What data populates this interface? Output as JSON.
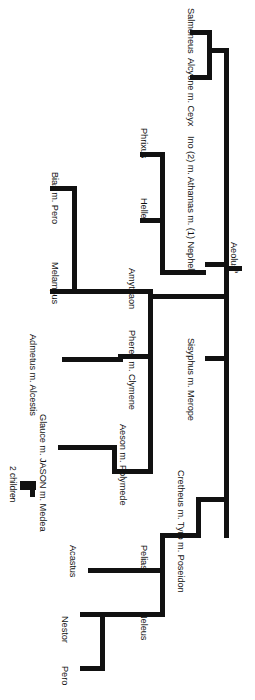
{
  "diagram": {
    "orientation": "rotated-90",
    "root": {
      "label": "Aeolus",
      "marker": "a"
    },
    "nodes": [
      {
        "id": "salmoneus",
        "label": "Salmoneus"
      },
      {
        "id": "alcyone",
        "label": "Alcyone m. Ceyx"
      },
      {
        "id": "ino",
        "label": "Ino (2) m. Athamas m. (1) Nephele"
      },
      {
        "id": "phrixus",
        "label": "Phrixus"
      },
      {
        "id": "helle",
        "label": "Helle"
      },
      {
        "id": "bias",
        "label": "Bias m. Pero"
      },
      {
        "id": "melampus",
        "label": "Melampus"
      },
      {
        "id": "amythaon",
        "label": "Amythaon"
      },
      {
        "id": "pheres",
        "label": "Pheres m. Clymene"
      },
      {
        "id": "sisyphus",
        "label": "Sisyphus m. Merope"
      },
      {
        "id": "admetus",
        "label": "Admetus m. Alcestis"
      },
      {
        "id": "glauce",
        "label": "Glauce m. JASON m. Medea"
      },
      {
        "id": "aeson",
        "label": "Aeson m. Polymede"
      },
      {
        "id": "children",
        "label": "2 children"
      },
      {
        "id": "cretheus",
        "label": "Cretheus m. Tyro m. Poseidon"
      },
      {
        "id": "acastus",
        "label": "Acastus"
      },
      {
        "id": "pelias",
        "label": "Pelias"
      },
      {
        "id": "neleus",
        "label": "Neleus"
      },
      {
        "id": "nestor",
        "label": "Nestor"
      },
      {
        "id": "pero",
        "label": "Pero"
      }
    ],
    "colors": {
      "line": "#111111",
      "text": "#111111",
      "background": "#ffffff"
    }
  }
}
